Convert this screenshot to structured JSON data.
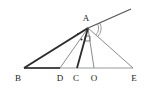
{
  "figure": {
    "name": "triangle-with-cevians",
    "canvas": {
      "width": 147,
      "height": 88
    },
    "background_color": "#ffffff",
    "stroke_color_dark": "#2b2b2b",
    "stroke_color_light": "#8c8c8c",
    "label_color": "#1a1a1a"
  },
  "points": {
    "A": {
      "label": "A",
      "x": 88,
      "y": 28,
      "label_x": 86,
      "label_y": 21
    },
    "B": {
      "label": "B",
      "x": 24,
      "y": 68,
      "label_x": 18,
      "label_y": 81
    },
    "D": {
      "label": "D",
      "x": 60,
      "y": 68,
      "label_x": 60,
      "label_y": 81
    },
    "C": {
      "label": "C",
      "x": 77,
      "y": 68,
      "label_x": 76,
      "label_y": 81
    },
    "O": {
      "label": "O",
      "x": 94,
      "y": 68,
      "label_x": 94,
      "label_y": 81
    },
    "E": {
      "label": "E",
      "x": 133,
      "y": 68,
      "label_x": 134,
      "label_y": 81
    },
    "ray_end": {
      "label": "",
      "x": 131,
      "y": 9
    }
  },
  "segments": [
    {
      "name": "segment-base-BD",
      "from": "B",
      "to": "D",
      "x1": 24,
      "y1": 68,
      "x2": 60,
      "y2": 68,
      "color": "#4a4a4a",
      "width": 2.2
    },
    {
      "name": "segment-base-DE",
      "from": "D",
      "to": "E",
      "x1": 60,
      "y1": 68,
      "x2": 133,
      "y2": 68,
      "color": "#9a9a9a",
      "width": 1.2
    },
    {
      "name": "segment-BA",
      "from": "B",
      "to": "A",
      "x1": 24,
      "y1": 68,
      "x2": 88,
      "y2": 28,
      "color": "#2b2b2b",
      "width": 2.0
    },
    {
      "name": "segment-AE",
      "from": "A",
      "to": "E",
      "x1": 88,
      "y1": 28,
      "x2": 133,
      "y2": 68,
      "color": "#8c8c8c",
      "width": 1.0
    },
    {
      "name": "cevian-AD",
      "from": "A",
      "to": "D",
      "x1": 88,
      "y1": 28,
      "x2": 60,
      "y2": 68,
      "color": "#8c8c8c",
      "width": 1.0
    },
    {
      "name": "cevian-AC",
      "from": "A",
      "to": "C",
      "x1": 88,
      "y1": 28,
      "x2": 77,
      "y2": 68,
      "color": "#2b2b2b",
      "width": 1.8
    },
    {
      "name": "cevian-AO",
      "from": "A",
      "to": "O",
      "x1": 88,
      "y1": 28,
      "x2": 94,
      "y2": 68,
      "color": "#8c8c8c",
      "width": 1.0
    },
    {
      "name": "ray-through-A",
      "from": "B",
      "to": "ray_end",
      "x1": 88,
      "y1": 28,
      "x2": 131,
      "y2": 9,
      "color": "#555555",
      "width": 1.2
    }
  ],
  "marks": {
    "angle_arcs": [
      {
        "name": "angle-arc-outer-at-A",
        "cx": 88,
        "cy": 28,
        "r": 13,
        "start_deg": -24,
        "end_deg": 42
      },
      {
        "name": "angle-arc-inner-at-A",
        "cx": 88,
        "cy": 28,
        "r": 10.5,
        "start_deg": -24,
        "end_deg": 42
      }
    ],
    "right_angle": {
      "name": "right-angle-marker-at-A",
      "x": 85,
      "y": 36,
      "size": 5
    },
    "tick_dots": [
      {
        "name": "angle-tick-dot-BA",
        "cx": 78,
        "cy": 34,
        "r": 1.0
      },
      {
        "name": "angle-tick-dot-AD",
        "cx": 81.5,
        "cy": 39.5,
        "r": 1.0
      }
    ]
  }
}
